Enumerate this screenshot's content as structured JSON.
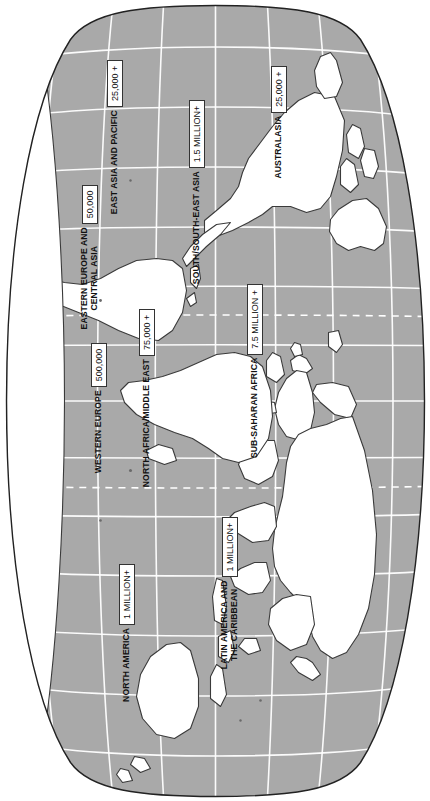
{
  "map": {
    "title": "World map of regional totals",
    "projection": "oval",
    "colors": {
      "ocean": "#a9a9a9",
      "land": "#ffffff",
      "coastline": "#3a3a3a",
      "graticule": "#ffffff",
      "frame": "#222222",
      "label_box_fill": "#ffffff",
      "label_box_border": "#333333",
      "text": "#111111"
    },
    "graticule": {
      "meridian_spacing_deg": 30,
      "parallel_spacing_deg": 20,
      "dashed_lines": [
        "Tropic of Cancer",
        "Tropic of Capricorn"
      ]
    }
  },
  "regions": [
    {
      "id": "north-america",
      "name": "NORTH AMERICA",
      "value": "1 MILLION+"
    },
    {
      "id": "latin-america",
      "name": "LATIN AMERICA AND\nTHE CARIBBEAN",
      "name_line1": "LATIN AMERICA AND",
      "name_line2": "THE CARIBBEAN",
      "value": "1 MILLION+"
    },
    {
      "id": "western-europe",
      "name": "WESTERN EUROPE",
      "value": "500,000"
    },
    {
      "id": "eastern-europe",
      "name": "EASTERN EUROPE AND\nCENTRAL ASIA",
      "name_line1": "EASTERN EUROPE AND",
      "name_line2": "CENTRAL ASIA",
      "value": "50,000"
    },
    {
      "id": "north-africa",
      "name": "NORTH AFRICA/MIDDLE EAST",
      "value": "75,000 +"
    },
    {
      "id": "sub-saharan-africa",
      "name": "SUB-SAHARAN AFRICA",
      "value": "7.5 MILLION +"
    },
    {
      "id": "south-south-east-asia",
      "name": "SOUTH/SOUTH-EAST ASIA",
      "value": "1.5 MILLION+"
    },
    {
      "id": "east-asia-pacific",
      "name": "EAST ASIA AND PACIFIC",
      "value": "25,000 +"
    },
    {
      "id": "australasia",
      "name": "AUSTRALASIA",
      "value": "25,000 +"
    }
  ]
}
